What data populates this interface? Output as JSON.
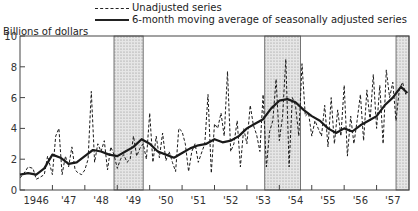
{
  "chart_data": {
    "type": "line",
    "title": "",
    "ylabel": "Billions of dollars",
    "xlabel": "",
    "ylim": [
      0,
      10
    ],
    "yticks": [
      0,
      2,
      4,
      6,
      8,
      10
    ],
    "xticks": [
      "1946",
      "'47",
      "'48",
      "'49",
      "'50",
      "'51",
      "'52",
      "'53",
      "'54",
      "'55",
      "'56",
      "'57"
    ],
    "xrange": [
      1946.0,
      1958.0
    ],
    "grid": false,
    "legend_position": "top-center",
    "shaded_periods": [
      {
        "start": 1948.9,
        "end": 1949.8,
        "label": "recession"
      },
      {
        "start": 1953.55,
        "end": 1954.65,
        "label": "recession"
      },
      {
        "start": 1957.6,
        "end": 1958.0,
        "label": "recession"
      }
    ],
    "series": [
      {
        "name": "Unadjusted series",
        "style": "dashed",
        "x": [
          1946.0,
          1946.1,
          1946.25,
          1946.4,
          1946.5,
          1946.6,
          1946.75,
          1946.85,
          1947.0,
          1947.1,
          1947.2,
          1947.3,
          1947.4,
          1947.5,
          1947.6,
          1947.7,
          1947.8,
          1947.9,
          1948.0,
          1948.1,
          1948.2,
          1948.3,
          1948.4,
          1948.5,
          1948.6,
          1948.7,
          1948.8,
          1948.9,
          1949.0,
          1949.1,
          1949.2,
          1949.3,
          1949.4,
          1949.5,
          1949.6,
          1949.7,
          1949.8,
          1949.9,
          1950.0,
          1950.1,
          1950.2,
          1950.3,
          1950.4,
          1950.5,
          1950.6,
          1950.7,
          1950.8,
          1950.9,
          1951.0,
          1951.1,
          1951.2,
          1951.3,
          1951.4,
          1951.5,
          1951.6,
          1951.7,
          1951.8,
          1951.9,
          1952.0,
          1952.1,
          1952.2,
          1952.3,
          1952.4,
          1952.5,
          1952.6,
          1952.7,
          1952.8,
          1952.9,
          1953.0,
          1953.1,
          1953.2,
          1953.3,
          1953.4,
          1953.5,
          1953.6,
          1953.7,
          1953.8,
          1953.9,
          1954.0,
          1954.1,
          1954.2,
          1954.3,
          1954.4,
          1954.5,
          1954.6,
          1954.7,
          1954.8,
          1954.9,
          1955.0,
          1955.1,
          1955.2,
          1955.3,
          1955.4,
          1955.5,
          1955.6,
          1955.7,
          1955.8,
          1955.9,
          1956.0,
          1956.1,
          1956.2,
          1956.3,
          1956.4,
          1956.5,
          1956.6,
          1956.7,
          1956.8,
          1956.9,
          1957.0,
          1957.1,
          1957.2,
          1957.3,
          1957.4,
          1957.5,
          1957.6,
          1957.7,
          1957.8,
          1957.9
        ],
        "values": [
          0.8,
          1.0,
          1.5,
          1.4,
          0.7,
          0.8,
          1.0,
          2.2,
          1.0,
          3.5,
          4.0,
          1.0,
          2.2,
          1.5,
          2.8,
          1.3,
          1.1,
          1.0,
          1.3,
          2.0,
          6.4,
          1.8,
          3.0,
          2.5,
          3.2,
          1.3,
          2.8,
          2.3,
          1.4,
          2.0,
          2.3,
          1.8,
          2.0,
          3.5,
          2.2,
          2.7,
          3.0,
          2.0,
          5.0,
          1.8,
          3.5,
          2.1,
          3.7,
          1.9,
          2.5,
          1.8,
          1.2,
          4.0,
          3.8,
          3.0,
          1.2,
          2.5,
          3.0,
          1.8,
          2.4,
          3.0,
          6.2,
          1.1,
          4.3,
          4.0,
          5.0,
          3.5,
          7.7,
          2.5,
          3.0,
          4.5,
          1.5,
          4.0,
          3.0,
          5.5,
          4.2,
          3.6,
          2.5,
          6.2,
          1.5,
          3.8,
          4.5,
          7.2,
          3.2,
          4.8,
          8.5,
          1.5,
          6.0,
          5.5,
          3.5,
          8.2,
          4.8,
          5.0,
          3.5,
          4.5,
          4.0,
          3.5,
          5.5,
          2.8,
          6.0,
          3.0,
          5.2,
          3.5,
          6.8,
          2.2,
          4.8,
          3.0,
          4.5,
          6.2,
          3.2,
          6.5,
          4.5,
          7.5,
          4.0,
          6.8,
          3.0,
          7.8,
          6.0,
          7.0,
          4.5,
          6.5,
          7.0,
          6.2
        ]
      },
      {
        "name": "6-month moving average of seasonally adjusted series",
        "style": "solid",
        "x": [
          1946.0,
          1946.25,
          1946.5,
          1946.75,
          1947.0,
          1947.25,
          1947.5,
          1947.75,
          1948.0,
          1948.25,
          1948.5,
          1948.75,
          1949.0,
          1949.25,
          1949.5,
          1949.75,
          1950.0,
          1950.25,
          1950.5,
          1950.75,
          1951.0,
          1951.25,
          1951.5,
          1951.75,
          1952.0,
          1952.25,
          1952.5,
          1952.75,
          1953.0,
          1953.25,
          1953.5,
          1953.75,
          1954.0,
          1954.25,
          1954.5,
          1954.75,
          1955.0,
          1955.25,
          1955.5,
          1955.75,
          1956.0,
          1956.25,
          1956.5,
          1956.75,
          1957.0,
          1957.25,
          1957.5,
          1957.75,
          1957.95
        ],
        "values": [
          1.0,
          1.1,
          1.0,
          1.4,
          2.3,
          2.1,
          1.7,
          1.8,
          2.2,
          2.6,
          2.5,
          2.3,
          2.2,
          2.5,
          2.8,
          3.3,
          3.0,
          2.5,
          2.3,
          2.1,
          2.4,
          2.7,
          2.9,
          3.0,
          3.3,
          3.1,
          3.2,
          3.5,
          4.0,
          4.3,
          4.6,
          5.3,
          5.8,
          5.9,
          5.7,
          5.2,
          4.8,
          4.5,
          4.0,
          3.7,
          4.0,
          3.8,
          4.2,
          4.5,
          4.8,
          5.5,
          6.0,
          6.7,
          6.3
        ]
      }
    ]
  },
  "legend": {
    "items": [
      {
        "label": "Unadjusted series"
      },
      {
        "label": "6-month moving average of seasonally adjusted series"
      }
    ]
  },
  "axis": {
    "ylabel": "Billions of dollars"
  }
}
